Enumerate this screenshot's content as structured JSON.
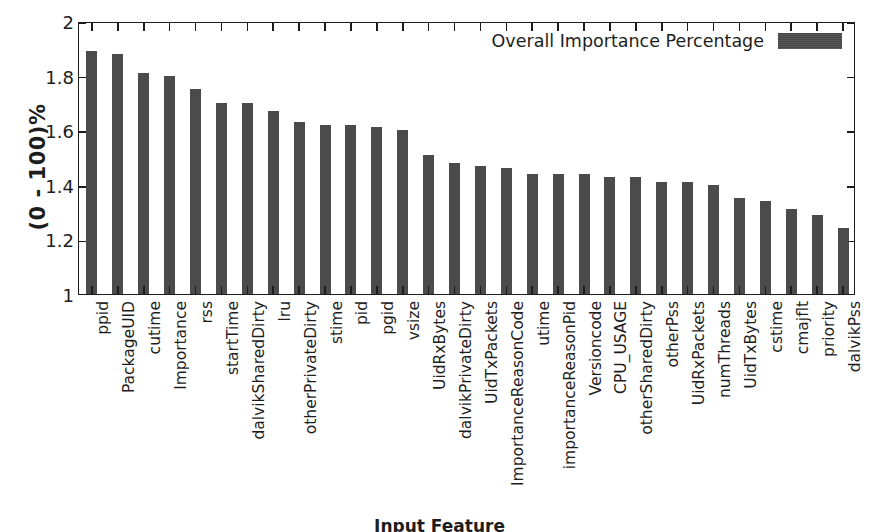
{
  "chart_data": {
    "type": "bar",
    "title": "",
    "subtitle": "",
    "xlabel": "Input Feature",
    "ylabel": "(0 - 100)%",
    "ylim": [
      1,
      2
    ],
    "yticks": [
      "1",
      "1.2",
      "1.4",
      "1.6",
      "1.8",
      "2"
    ],
    "ytick_values": [
      1,
      1.2,
      1.4,
      1.6,
      1.8,
      2
    ],
    "grid": false,
    "legend": {
      "position": "top-right-inside",
      "entries": [
        {
          "label": "Overall Importance Percentage",
          "color": "#4b4b4b"
        }
      ]
    },
    "bar_color": "#4b4b4b",
    "categories": [
      "ppid",
      "PackageUID",
      "cutime",
      "Importance",
      "rss",
      "startTime",
      "dalvikSharedDirty",
      "lru",
      "otherPrivateDirty",
      "stime",
      "pid",
      "pgid",
      "vsize",
      "UidRxBytes",
      "dalvikPrivateDirty",
      "UidTxPackets",
      "ImportanceReasonCode",
      "utime",
      "importanceReasonPid",
      "Versioncode",
      "CPU_USAGE",
      "otherSharedDirty",
      "otherPss",
      "UidRxPackets",
      "numThreads",
      "UidTxBytes",
      "cstime",
      "cmajflt",
      "priority",
      "dalvikPss"
    ],
    "values": [
      1.89,
      1.88,
      1.81,
      1.8,
      1.75,
      1.7,
      1.7,
      1.67,
      1.63,
      1.62,
      1.62,
      1.61,
      1.6,
      1.51,
      1.48,
      1.47,
      1.46,
      1.44,
      1.44,
      1.44,
      1.43,
      1.43,
      1.41,
      1.41,
      1.4,
      1.35,
      1.34,
      1.31,
      1.29,
      1.24
    ],
    "series": [
      {
        "name": "Overall Importance Percentage",
        "values": [
          1.89,
          1.88,
          1.81,
          1.8,
          1.75,
          1.7,
          1.7,
          1.67,
          1.63,
          1.62,
          1.62,
          1.61,
          1.6,
          1.51,
          1.48,
          1.47,
          1.46,
          1.44,
          1.44,
          1.44,
          1.43,
          1.43,
          1.41,
          1.41,
          1.4,
          1.35,
          1.34,
          1.31,
          1.29,
          1.24
        ]
      }
    ]
  }
}
